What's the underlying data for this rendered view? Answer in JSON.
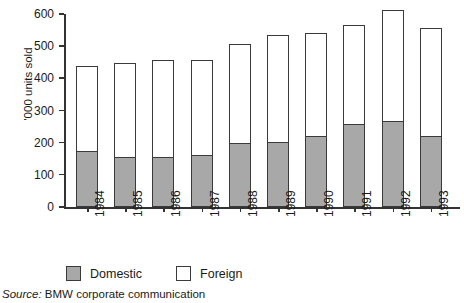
{
  "chart_data": {
    "type": "bar",
    "subtype": "stacked-vertical",
    "title": "",
    "xlabel": "",
    "ylabel": "'000 units sold",
    "ylim": [
      0,
      600
    ],
    "yticks": [
      0,
      100,
      200,
      300,
      400,
      500,
      600
    ],
    "grid": false,
    "legend_position": "bottom-left",
    "categories": [
      "1984",
      "1985",
      "1986",
      "1987",
      "1988",
      "1989",
      "1990",
      "1991",
      "1992",
      "1993"
    ],
    "series": [
      {
        "name": "Domestic",
        "color": "#a8a8a8",
        "values": [
          172,
          153,
          153,
          159,
          196,
          202,
          220,
          255,
          265,
          220
        ]
      },
      {
        "name": "Foreign",
        "color": "#ffffff",
        "values": [
          264,
          294,
          302,
          295,
          310,
          332,
          320,
          310,
          346,
          335
        ]
      }
    ],
    "totals": [
      436,
      447,
      455,
      454,
      506,
      534,
      540,
      565,
      611,
      555
    ],
    "annotations": []
  },
  "axis": {
    "y_title": "'000 units sold",
    "y_tick_labels": [
      "600",
      "500",
      "400",
      "300",
      "200",
      "100",
      "0"
    ]
  },
  "legend": {
    "items": [
      {
        "label": "Domestic",
        "swatch": "gray-filled-square"
      },
      {
        "label": "Foreign",
        "swatch": "white-outlined-square"
      }
    ]
  },
  "source": {
    "prefix": "Source:",
    "text": "BMW corporate communication"
  },
  "colors": {
    "domestic": "#a8a8a8",
    "foreign": "#ffffff",
    "outline": "#3a3a3a",
    "axis": "#333333",
    "text": "#1a1a1a"
  }
}
